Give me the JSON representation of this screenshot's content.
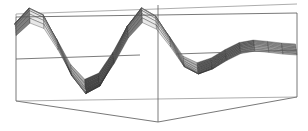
{
  "figure": {
    "title": "",
    "background_color": "#ffffff",
    "line_color": "#555555",
    "mesh_line_color": "#2b2b2b",
    "width": 308,
    "height": 131
  },
  "chart_data": {
    "type": "line",
    "render": "surface3d-wireframe",
    "title": "",
    "subtitle": "",
    "xlabel": "",
    "ylabel": "",
    "zlabel": "",
    "grid": false,
    "legend": "none",
    "axis_ticks_visible": false,
    "tick_labels": [],
    "annotations": [],
    "projection": {
      "type": "parallel-oblique",
      "elevation_deg": 18,
      "azimuth_deg": -62
    },
    "surface_function": "z = exp(-a*x) * sin(b*x) envelope along x, mildly modulated across y",
    "x": [
      0.0,
      0.05,
      0.1,
      0.15,
      0.2,
      0.25,
      0.3,
      0.35,
      0.4,
      0.45,
      0.5,
      0.55,
      0.6,
      0.65,
      0.7,
      0.75,
      0.8,
      0.85,
      0.9,
      0.95,
      1.0
    ],
    "y": [
      0.0,
      0.125,
      0.25,
      0.375,
      0.5,
      0.625,
      0.75,
      0.875,
      1.0
    ],
    "z_profile": [
      0.62,
      0.95,
      0.8,
      0.22,
      -0.46,
      -0.86,
      -0.7,
      -0.15,
      0.52,
      0.92,
      0.74,
      0.26,
      -0.28,
      -0.46,
      -0.34,
      -0.12,
      0.06,
      0.12,
      0.08,
      0.03,
      0.0
    ],
    "zlim": [
      -1.0,
      1.0
    ],
    "xlim": [
      0.0,
      1.0
    ],
    "ylim": [
      0.0,
      1.0
    ],
    "mesh_rows": 9,
    "mesh_cols": 21,
    "shading": {
      "model": "lambert-grayscale",
      "light_min": "#3a3a3a",
      "light_max": "#f2f2f2"
    }
  },
  "bounding_box": {
    "visible": true,
    "edges": [
      "front-top",
      "front-bottom",
      "front-left-vertical",
      "front-right-vertical",
      "back-top",
      "back-bottom",
      "mid-plane-left",
      "mid-plane-right",
      "center-vertical"
    ],
    "mid_plane_visible": true,
    "center_vertical_visible": true
  }
}
